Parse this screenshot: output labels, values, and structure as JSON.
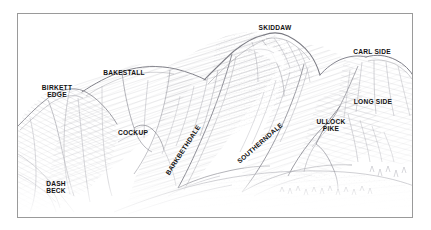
{
  "figure": {
    "kind": "pen-and-ink mountain panorama illustration",
    "frame_color": "#9a9a9a",
    "background_color": "#ffffff",
    "ink_color": "#8d8d93"
  },
  "labels": [
    {
      "id": "skiddaw",
      "text": "SKIDDAW",
      "x": 275,
      "y": 27,
      "rotation": 0,
      "lines": 1
    },
    {
      "id": "carl-side",
      "text": "CARL SIDE",
      "x": 372,
      "y": 51,
      "rotation": 0,
      "lines": 1
    },
    {
      "id": "bakestall",
      "text": "BAKESTALL",
      "x": 124,
      "y": 72,
      "rotation": 0,
      "lines": 1
    },
    {
      "id": "birkett-edge",
      "text": "BIRKETT\nEDGE",
      "x": 57,
      "y": 90,
      "rotation": 0,
      "lines": 2
    },
    {
      "id": "long-side",
      "text": "LONG SIDE",
      "x": 373,
      "y": 101,
      "rotation": 0,
      "lines": 1
    },
    {
      "id": "ullock-pike",
      "text": "ULLOCK\nPIKE",
      "x": 331,
      "y": 124,
      "rotation": 0,
      "lines": 2
    },
    {
      "id": "cockup",
      "text": "COCKUP",
      "x": 133,
      "y": 132,
      "rotation": 0,
      "lines": 1
    },
    {
      "id": "barkbethdale",
      "text": "BARKBETHDALE",
      "x": 183,
      "y": 149,
      "rotation": -57,
      "lines": 1
    },
    {
      "id": "southerndale",
      "text": "SOUTHERNDALE",
      "x": 260,
      "y": 142,
      "rotation": -41,
      "lines": 1
    },
    {
      "id": "dash-beck",
      "text": "DASH\nBECK",
      "x": 56,
      "y": 186,
      "rotation": 0,
      "lines": 2
    }
  ]
}
